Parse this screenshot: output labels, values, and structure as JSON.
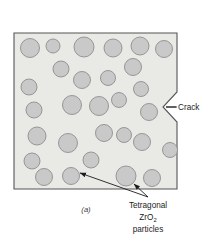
{
  "figure": {
    "caption": "(a)",
    "labels": {
      "crack": "Crack",
      "particles_line1": "Tetragonal",
      "particles_line2_pre": "ZrO",
      "particles_line2_sub": "2",
      "particles_line3": "particles"
    },
    "colors": {
      "page_background": "#ffffff",
      "matrix_fill": "#e9e9e6",
      "matrix_stroke": "#555555",
      "particle_fill": "#c9c9c9",
      "particle_stroke": "#8f8f8f",
      "leader_line": "#1c1c1c",
      "text": "#1c1c1c"
    },
    "matrix": {
      "shape_name": "ceramic-matrix-with-crack",
      "outline_points": "14,33 177,33 177,92 163,107 177,122 177,189 14,189",
      "crack_notch": {
        "entry_x": 177,
        "entry_top_y": 92,
        "apex_x": 163,
        "apex_y": 107,
        "entry_bottom_y": 122
      }
    },
    "particles": [
      {
        "cx": 30,
        "cy": 48,
        "r": 9.5
      },
      {
        "cx": 53,
        "cy": 46,
        "r": 7.0
      },
      {
        "cx": 84,
        "cy": 47,
        "r": 10.0
      },
      {
        "cx": 113,
        "cy": 48,
        "r": 9.0
      },
      {
        "cx": 140,
        "cy": 46,
        "r": 9.0
      },
      {
        "cx": 164,
        "cy": 49,
        "r": 8.5
      },
      {
        "cx": 61,
        "cy": 69,
        "r": 8.0
      },
      {
        "cx": 133,
        "cy": 67,
        "r": 8.5
      },
      {
        "cx": 29,
        "cy": 87,
        "r": 8.0
      },
      {
        "cx": 82,
        "cy": 80,
        "r": 8.5
      },
      {
        "cx": 108,
        "cy": 78,
        "r": 7.5
      },
      {
        "cx": 141,
        "cy": 89,
        "r": 7.5
      },
      {
        "cx": 34,
        "cy": 110,
        "r": 8.0
      },
      {
        "cx": 72,
        "cy": 105,
        "r": 9.5
      },
      {
        "cx": 99,
        "cy": 106,
        "r": 9.5
      },
      {
        "cx": 119,
        "cy": 100,
        "r": 7.5
      },
      {
        "cx": 149,
        "cy": 112,
        "r": 8.5
      },
      {
        "cx": 37,
        "cy": 136,
        "r": 9.0
      },
      {
        "cx": 68,
        "cy": 143,
        "r": 9.5
      },
      {
        "cx": 104,
        "cy": 133,
        "r": 8.5
      },
      {
        "cx": 124,
        "cy": 135,
        "r": 7.5
      },
      {
        "cx": 142,
        "cy": 142,
        "r": 8.5
      },
      {
        "cx": 170,
        "cy": 150,
        "r": 7.5
      },
      {
        "cx": 32,
        "cy": 161,
        "r": 8.0
      },
      {
        "cx": 91,
        "cy": 160,
        "r": 8.0
      },
      {
        "cx": 44,
        "cy": 177,
        "r": 8.5
      },
      {
        "cx": 71,
        "cy": 176,
        "r": 8.5
      },
      {
        "cx": 126,
        "cy": 176,
        "r": 10.0
      },
      {
        "cx": 152,
        "cy": 178,
        "r": 8.5
      }
    ],
    "leaders": [
      {
        "name": "crack-leader",
        "path": "M 177 107 L 166 107",
        "arrow": false
      },
      {
        "name": "particle-leader-left",
        "path": "M 148 198 L 78 172",
        "arrow": true,
        "arrow_at": "78,172",
        "arrow_angle": 200
      },
      {
        "name": "particle-leader-right",
        "path": "M 148 198 L 133 183",
        "arrow": true,
        "arrow_at": "133,183",
        "arrow_angle": 225
      }
    ],
    "text_positions": {
      "crack": {
        "x": 178,
        "y": 110
      },
      "particles_line1": {
        "x": 148,
        "y": 208
      },
      "particles_line2": {
        "x": 148,
        "y": 220
      },
      "particles_line3": {
        "x": 148,
        "y": 232
      },
      "caption": {
        "x": 86,
        "y": 212
      }
    }
  }
}
